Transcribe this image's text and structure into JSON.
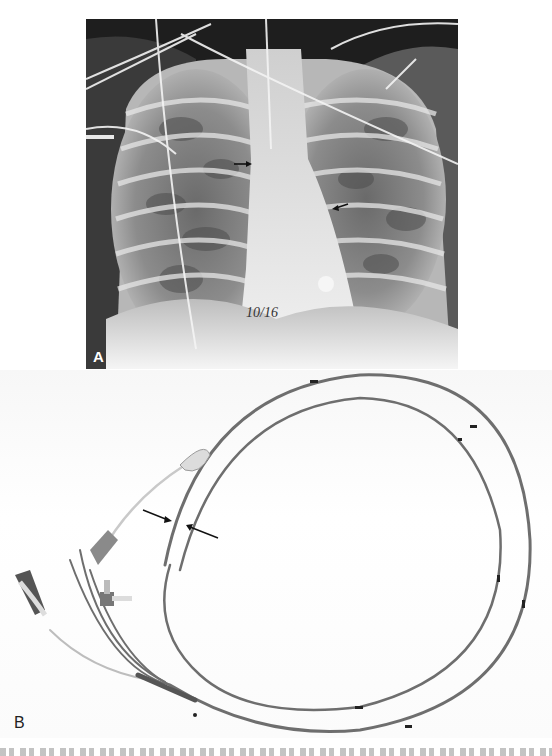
{
  "figure": {
    "panels": [
      {
        "id": "A",
        "label": "A",
        "content": "chest x-ray",
        "annotation": "10/16",
        "arrows": 2
      },
      {
        "id": "B",
        "label": "B",
        "content": "catheter photograph",
        "arrows": 2
      }
    ],
    "caption_visible": "clipped at bottom edge (unreadable)"
  },
  "colors": {
    "xray_background": "#1a1a1a",
    "page_background": "#ffffff",
    "catheter": "#6e6e6e"
  }
}
